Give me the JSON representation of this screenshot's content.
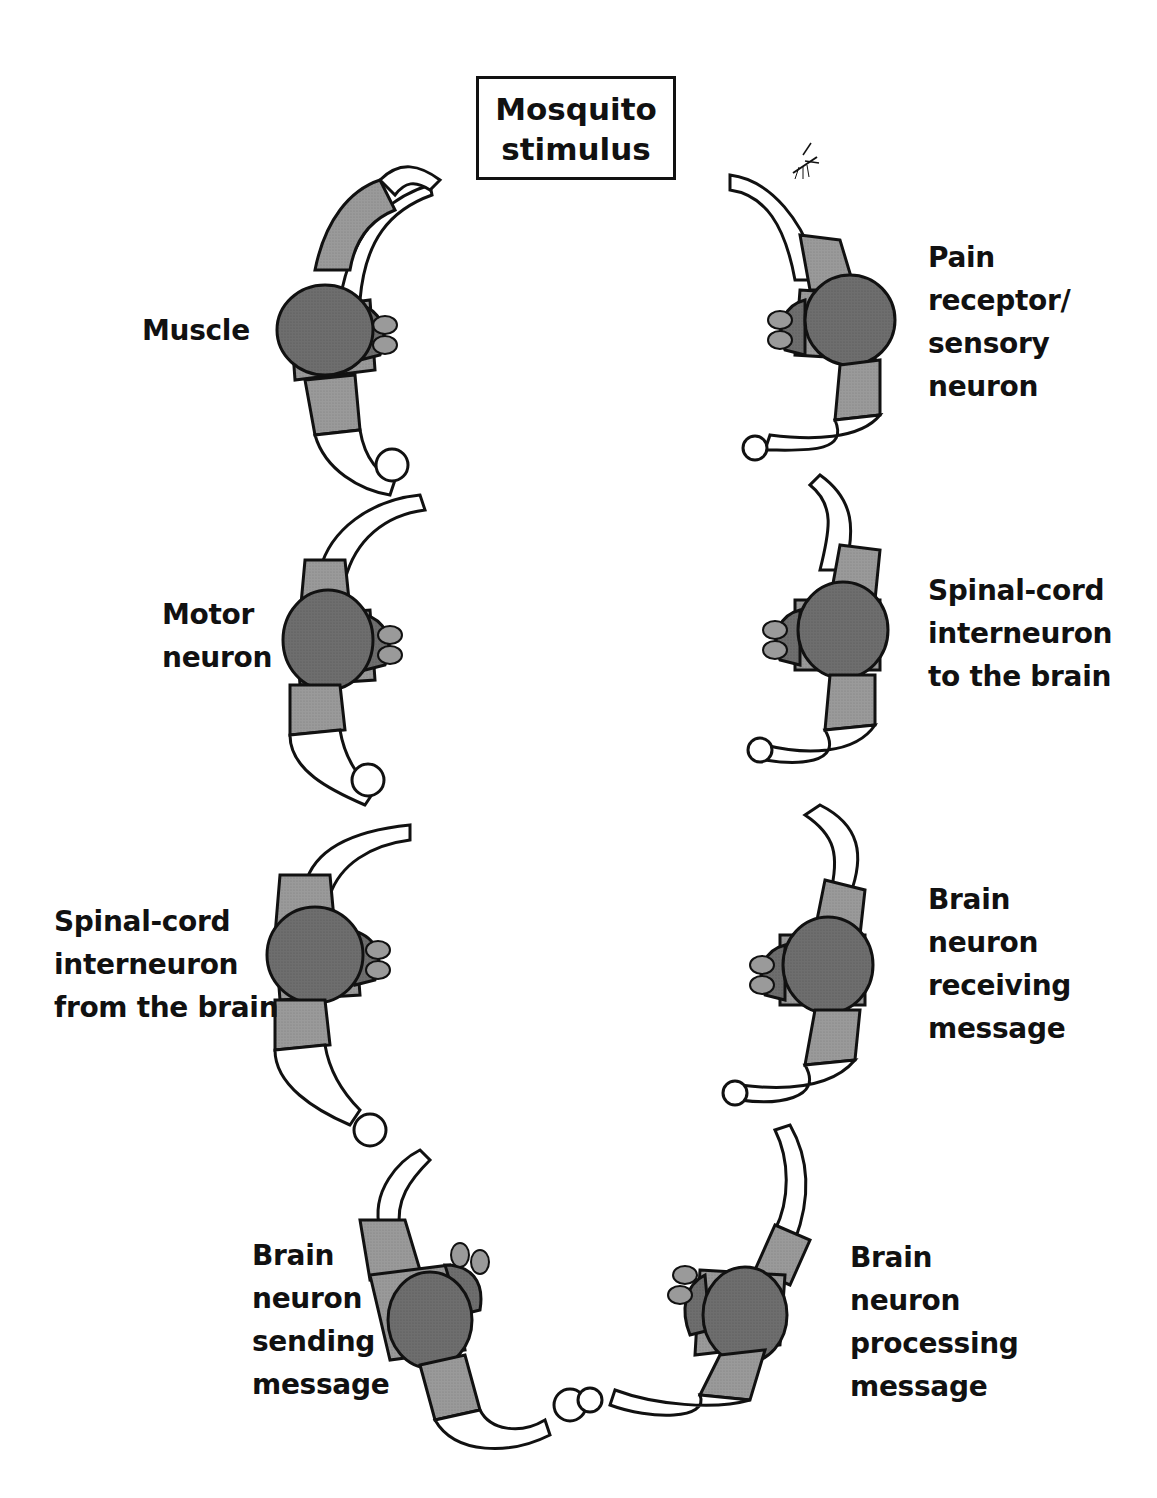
{
  "diagram": {
    "title": {
      "line1": "Mosquito",
      "line2": "stimulus"
    },
    "stimulus_icon": "mosquito-icon",
    "colors": {
      "outline": "#111111",
      "shirt": "#9a9a9a",
      "hair": "#6e6e6e",
      "dark": "#4a4a4a",
      "skin": "#ffffff",
      "background": "#ffffff"
    },
    "chain_order": [
      "pain-receptor-sensory-neuron",
      "spinal-cord-interneuron-to-brain",
      "brain-neuron-receiving-message",
      "brain-neuron-processing-message",
      "brain-neuron-sending-message",
      "spinal-cord-interneuron-from-brain",
      "motor-neuron",
      "muscle"
    ],
    "labels": {
      "muscle": [
        "Muscle"
      ],
      "motor_neuron": [
        "Motor",
        "neuron"
      ],
      "spinal_from_brain": [
        "Spinal-cord",
        "interneuron",
        "from the brain"
      ],
      "brain_sending": [
        "Brain",
        "neuron",
        "sending",
        "message"
      ],
      "pain_receptor": [
        "Pain",
        "receptor/",
        "sensory",
        "neuron"
      ],
      "spinal_to_brain": [
        "Spinal-cord",
        "interneuron",
        "to the brain"
      ],
      "brain_receiving": [
        "Brain",
        "neuron",
        "receiving",
        "message"
      ],
      "brain_processing": [
        "Brain",
        "neuron",
        "processing",
        "message"
      ]
    }
  }
}
